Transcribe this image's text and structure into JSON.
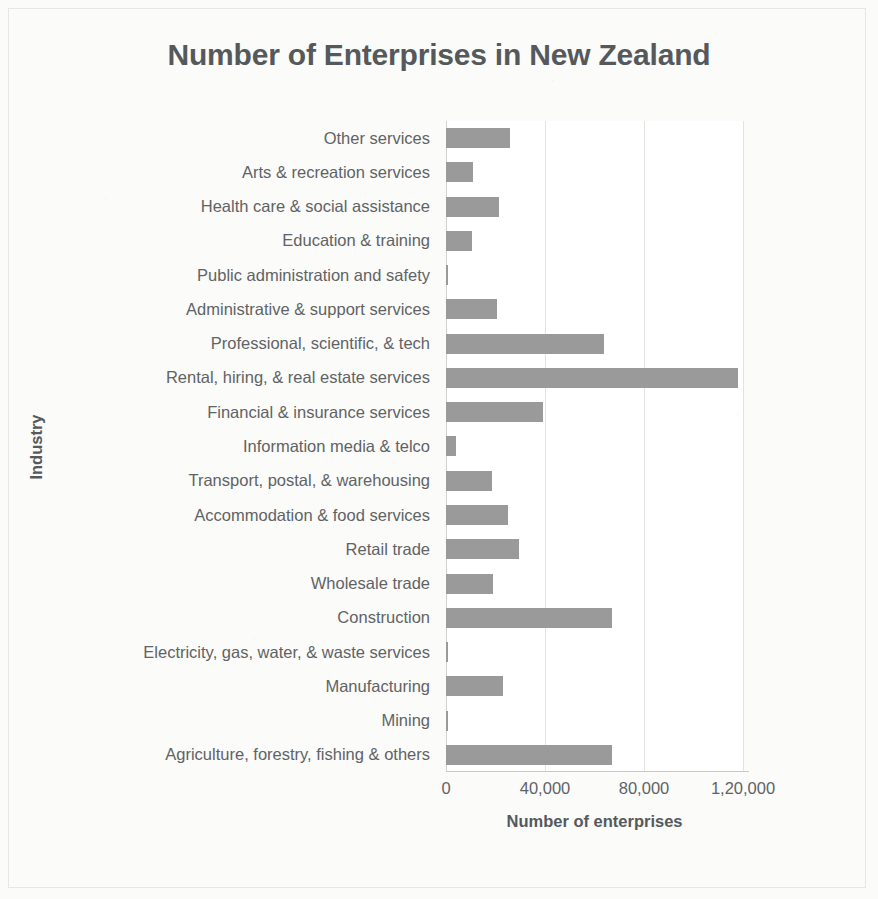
{
  "chart_data": {
    "type": "bar",
    "orientation": "horizontal",
    "title": "Number of Enterprises in New Zealand",
    "xlabel": "Number of enterprises",
    "ylabel": "Industry",
    "xlim": [
      0,
      120000
    ],
    "xticks": [
      0,
      40000,
      80000,
      120000
    ],
    "xtick_labels": [
      "0",
      "40,000",
      "80,000",
      "1,20,000"
    ],
    "grid": true,
    "legend": false,
    "bar_color": "#9a9a9a",
    "categories": [
      "Other services",
      "Arts & recreation services",
      "Health care & social assistance",
      "Education & training",
      "Public administration and safety",
      "Administrative & support services",
      "Professional, scientific, & tech",
      "Rental, hiring, & real estate services",
      "Financial & insurance services",
      "Information media & telco",
      "Transport, postal, & warehousing",
      "Accommodation & food services",
      "Retail trade",
      "Wholesale trade",
      "Construction",
      "Electricity, gas, water, & waste services",
      "Manufacturing",
      "Mining",
      "Agriculture, forestry, fishing & others"
    ],
    "values": [
      26000,
      11000,
      21500,
      10500,
      1000,
      20500,
      64000,
      118000,
      39000,
      4000,
      18500,
      25000,
      29500,
      19000,
      67000,
      900,
      23000,
      700,
      67000
    ]
  }
}
